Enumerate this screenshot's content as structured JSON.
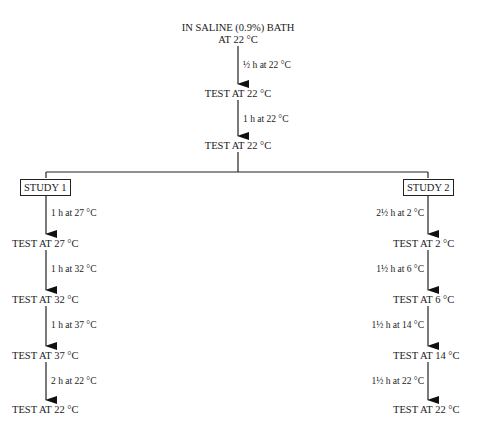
{
  "top": {
    "start_line1": "IN SALINE (0.9%) BATH",
    "start_line2": "AT 22 °C",
    "step1_label": "½ h at 22 °C",
    "test1": "TEST AT 22 °C",
    "step2_label": "1 h at 22 °C",
    "test2": "TEST AT 22 °C"
  },
  "study1": {
    "title": "STUDY 1",
    "steps": [
      {
        "label": "1 h at 27 °C",
        "test": "TEST AT 27 °C"
      },
      {
        "label": "1 h at 32 °C",
        "test": "TEST AT 32 °C"
      },
      {
        "label": "1 h at 37 °C",
        "test": "TEST AT 37 °C"
      },
      {
        "label": "2 h at 22 °C",
        "test": "TEST AT 22 °C"
      }
    ]
  },
  "study2": {
    "title": "STUDY 2",
    "steps": [
      {
        "label": "2½ h at 2 °C",
        "test": "TEST AT 2 °C"
      },
      {
        "label": "1½ h at 6 °C",
        "test": "TEST AT 6 °C"
      },
      {
        "label": "1½ h at 14 °C",
        "test": "TEST AT 14 °C"
      },
      {
        "label": "1½ h at 22 °C",
        "test": "TEST AT 22 °C"
      }
    ]
  }
}
